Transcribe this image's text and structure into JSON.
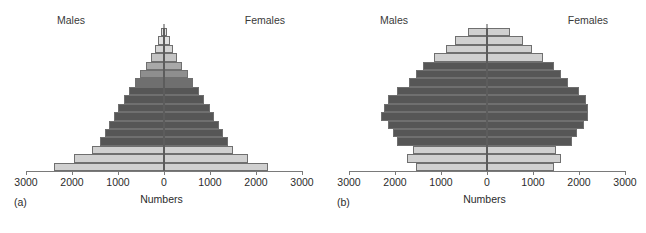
{
  "figure": {
    "axis_title": "Numbers",
    "male_label": "Males",
    "female_label": "Females",
    "tick_labels": [
      "3000",
      "2000",
      "1000",
      "0",
      "1000",
      "2000",
      "3000"
    ],
    "colors": {
      "dark_gray": "#565656",
      "mid_gray": "#8e8e8e",
      "light_gray": "#d0d0d0",
      "pale_gray": "#e2e2e2",
      "outline": "#6f6f6f",
      "axis": "#7a7a7a",
      "center_line": "#4a4a4a",
      "background": "#ffffff"
    }
  },
  "chart_data": [
    {
      "type": "bar",
      "panel": "a",
      "caption": "(a)",
      "title": "",
      "subtitle": "",
      "xlabel": "Numbers",
      "ylabel": "",
      "orientation": "horizontal",
      "layout": "population-pyramid",
      "grid": false,
      "legend": "none",
      "xlim": [
        -3000,
        3000
      ],
      "xticks": [
        -3000,
        -2000,
        -1000,
        0,
        1000,
        2000,
        3000
      ],
      "xticklabels": [
        "3000",
        "2000",
        "1000",
        "0",
        "1000",
        "2000",
        "3000"
      ],
      "categories": [
        "row-01-top",
        "row-02",
        "row-03",
        "row-04",
        "row-05",
        "row-06",
        "row-07",
        "row-08",
        "row-09",
        "row-10",
        "row-11",
        "row-12",
        "row-13",
        "row-14",
        "row-15",
        "row-16",
        "row-17-base"
      ],
      "series": [
        {
          "name": "Males",
          "values": [
            60,
            120,
            190,
            280,
            400,
            520,
            640,
            760,
            880,
            990,
            1090,
            1190,
            1290,
            1390,
            1560,
            1950,
            2400
          ]
        },
        {
          "name": "Females",
          "values": [
            60,
            120,
            190,
            280,
            400,
            520,
            640,
            760,
            880,
            990,
            1090,
            1190,
            1290,
            1390,
            1500,
            1830,
            2250
          ]
        }
      ],
      "bar_colors": [
        "#e2e2e2",
        "#e2e2e2",
        "#d6d6d6",
        "#c4c4c4",
        "#a8a8a8",
        "#8e8e8e",
        "#6f6f6f",
        "#565656",
        "#565656",
        "#565656",
        "#565656",
        "#565656",
        "#565656",
        "#565656",
        "#d0d0d0",
        "#d0d0d0",
        "#d0d0d0"
      ]
    },
    {
      "type": "bar",
      "panel": "b",
      "caption": "(b)",
      "title": "",
      "subtitle": "",
      "xlabel": "Numbers",
      "ylabel": "",
      "orientation": "horizontal",
      "layout": "population-pyramid",
      "grid": false,
      "legend": "none",
      "xlim": [
        -3000,
        3000
      ],
      "xticks": [
        -3000,
        -2000,
        -1000,
        0,
        1000,
        2000,
        3000
      ],
      "xticklabels": [
        "3000",
        "2000",
        "1000",
        "0",
        "1000",
        "2000",
        "3000"
      ],
      "categories": [
        "row-01-top",
        "row-02",
        "row-03",
        "row-04",
        "row-05",
        "row-06",
        "row-07",
        "row-08",
        "row-09",
        "row-10",
        "row-11",
        "row-12",
        "row-13",
        "row-14",
        "row-15",
        "row-16",
        "row-17-base"
      ],
      "series": [
        {
          "name": "Males",
          "values": [
            420,
            700,
            900,
            1150,
            1400,
            1550,
            1700,
            1950,
            2150,
            2250,
            2300,
            2150,
            2050,
            1950,
            1600,
            1750,
            1550
          ]
        },
        {
          "name": "Females",
          "values": [
            500,
            780,
            980,
            1220,
            1450,
            1600,
            1750,
            2000,
            2150,
            2200,
            2200,
            2100,
            1950,
            1850,
            1500,
            1600,
            1450
          ]
        }
      ],
      "bar_colors": [
        "#d0d0d0",
        "#d0d0d0",
        "#d0d0d0",
        "#d0d0d0",
        "#565656",
        "#565656",
        "#565656",
        "#565656",
        "#565656",
        "#565656",
        "#565656",
        "#565656",
        "#565656",
        "#565656",
        "#d0d0d0",
        "#d0d0d0",
        "#d0d0d0"
      ]
    }
  ]
}
